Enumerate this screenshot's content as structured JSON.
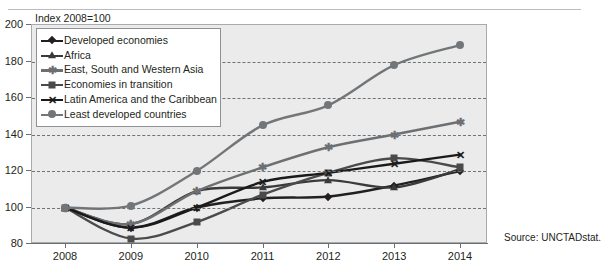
{
  "figure": {
    "index_note": "Index 2008=100",
    "source": "Source: UNCTADstat.",
    "background_color": "#ebebeb",
    "frame_color": "#a8abad",
    "grid_color": "#6f7376"
  },
  "chart_data": {
    "type": "line",
    "title": "Index 2008=100",
    "xlabel": "",
    "ylabel": "",
    "x": [
      2008,
      2009,
      2010,
      2011,
      2012,
      2013,
      2014
    ],
    "xtick_labels": [
      "2008",
      "2009",
      "2010",
      "2011",
      "2012",
      "2013",
      "2014"
    ],
    "ytick_labels": [
      "80",
      "100",
      "120",
      "140",
      "160",
      "180",
      "200"
    ],
    "ylim": [
      80,
      200
    ],
    "ytick_values": [
      80,
      100,
      120,
      140,
      160,
      180,
      200
    ],
    "grid": true,
    "grid_axis": "y",
    "legend_position": "upper-left",
    "series": [
      {
        "name": "Developed economies",
        "marker": "diamond",
        "color": "#231f20",
        "values": [
          100,
          89,
          100,
          105,
          106,
          112,
          120
        ]
      },
      {
        "name": "Africa",
        "marker": "triangle",
        "color": "#3a3a3a",
        "values": [
          100,
          91,
          109,
          111,
          115,
          111,
          121
        ]
      },
      {
        "name": "East, South and Western Asia",
        "marker": "asterisk",
        "color": "#6d7073",
        "values": [
          100,
          91,
          109,
          122,
          133,
          140,
          147
        ]
      },
      {
        "name": "Economies in transition",
        "marker": "square",
        "color": "#4a4a4a",
        "values": [
          100,
          83,
          92,
          107,
          119,
          127,
          122
        ]
      },
      {
        "name": "Latin America and the Caribbean",
        "marker": "cross",
        "color": "#1a1a1a",
        "values": [
          100,
          89,
          100,
          114,
          119,
          124,
          129
        ]
      },
      {
        "name": "Least developed countries",
        "marker": "circle",
        "color": "#737679",
        "values": [
          100,
          101,
          120,
          145,
          156,
          178,
          189
        ]
      }
    ]
  }
}
